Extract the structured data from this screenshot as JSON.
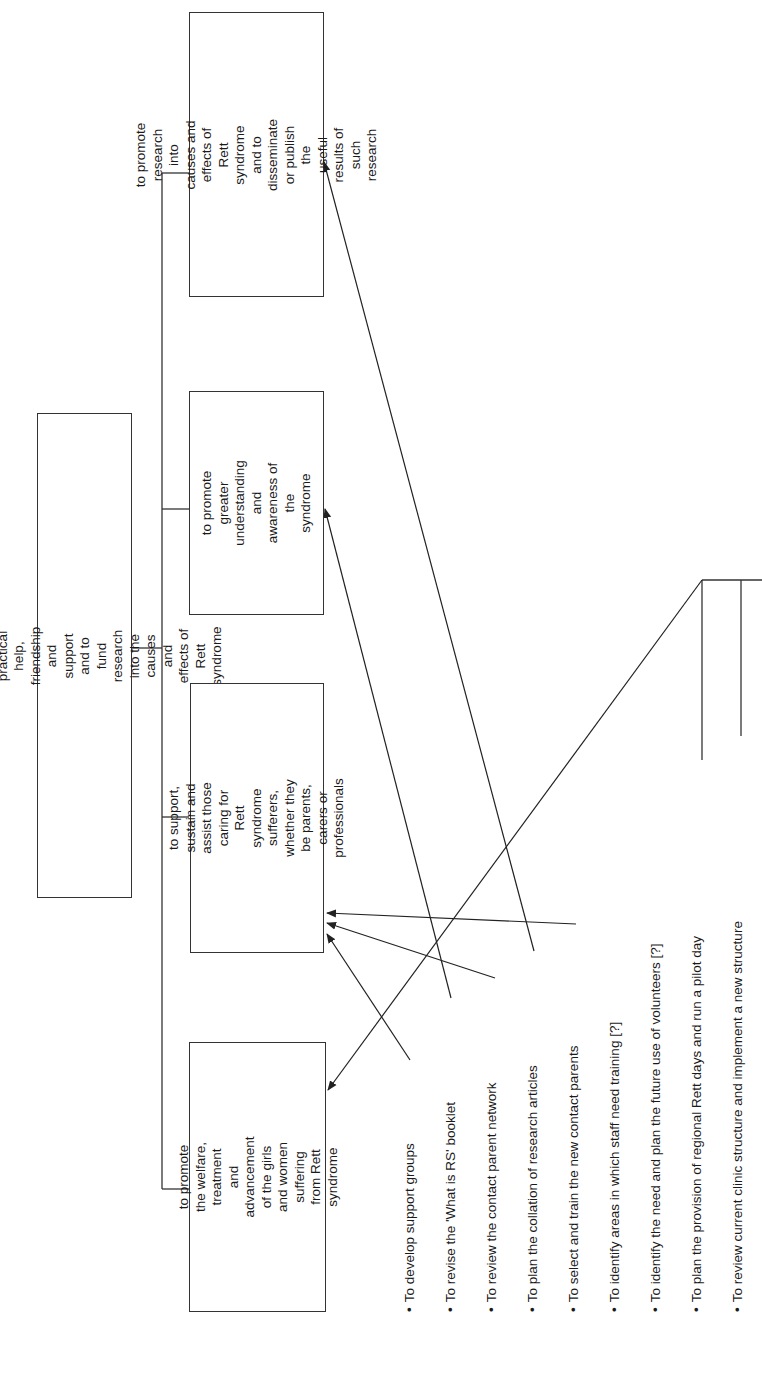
{
  "diagram": {
    "orientation": "rotated 90deg counter-clockwise",
    "root": {
      "text": "To raise money to provide practical help, friendship\nand support and to fund research into the causes and\neffects of Rett syndrome"
    },
    "objectives": [
      {
        "id": "research",
        "text": "to promote research into\ncauses and effects of Rett\nsyndrome and to\ndisseminate or publish the\nuseful results of such research"
      },
      {
        "id": "awareness",
        "text": "to promote greater\nunderstanding and\nawareness of the\nsyndrome"
      },
      {
        "id": "support",
        "text": "to support, sustain and\nassist those caring for\nRett syndrome sufferers,\nwhether they be parents,\ncarers or professionals"
      },
      {
        "id": "welfare",
        "text": "to promote the welfare,\ntreatment and advancement\nof the girls and women\nsuffering from Rett syndrome"
      }
    ],
    "bullet_marker": "•",
    "actions": [
      {
        "text": "To develop support groups",
        "targets": [
          "support"
        ]
      },
      {
        "text": "To revise the 'What is RS' booklet",
        "targets": [
          "awareness"
        ]
      },
      {
        "text": "To review the contact parent network",
        "targets": [
          "support"
        ]
      },
      {
        "text": "To plan the collation of research articles",
        "targets": [
          "research"
        ]
      },
      {
        "text": "To select and train the new contact parents",
        "targets": [
          "support"
        ]
      },
      {
        "text": "To identify areas in which staff need training [?]",
        "targets": []
      },
      {
        "text": "To identify the need and plan the future use of volunteers [?]",
        "targets": []
      },
      {
        "text": "To plan the provision of regional Rett days and run a pilot day",
        "targets": [
          "welfare"
        ]
      },
      {
        "text": "To review current clinic structure and implement a new structure",
        "targets": [
          "welfare"
        ]
      }
    ],
    "colors": {
      "line": "#333333",
      "text": "#1a1a1a",
      "background": "#ffffff"
    }
  }
}
